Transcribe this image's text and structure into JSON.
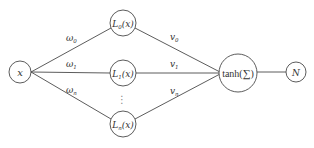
{
  "diagram": {
    "type": "neural-network",
    "colors": {
      "stroke": "#4a4a4a",
      "text": "#333333",
      "background": "#ffffff"
    },
    "nodes": {
      "input": {
        "label": "x",
        "cx": 20,
        "cy": 72,
        "r": 11
      },
      "hidden": [
        {
          "label_main": "L",
          "label_sub": "0",
          "label_arg": "(x)",
          "cx": 123,
          "cy": 23,
          "r": 13
        },
        {
          "label_main": "L",
          "label_sub": "1",
          "label_arg": "(x)",
          "cx": 123,
          "cy": 73,
          "r": 13
        },
        {
          "label_main": "L",
          "label_sub": "n",
          "label_arg": "(x)",
          "cx": 123,
          "cy": 124,
          "r": 13
        }
      ],
      "ellipsis": {
        "symbol": "⋮",
        "x": 122,
        "y": 99
      },
      "activation": {
        "label_func": "tanh(",
        "label_sigma": "∑",
        "label_close": ")",
        "cx": 238,
        "cy": 73,
        "r": 19
      },
      "output": {
        "label": "N",
        "cx": 296,
        "cy": 72,
        "r": 10
      }
    },
    "input_weights": [
      {
        "symbol": "ω",
        "sub": "0",
        "x": 66,
        "y": 41
      },
      {
        "symbol": "ω",
        "sub": "1",
        "x": 66,
        "y": 67
      },
      {
        "symbol": "ω",
        "sub": "n",
        "x": 66,
        "y": 93
      }
    ],
    "output_weights": [
      {
        "symbol": "v",
        "sub": "0",
        "x": 170,
        "y": 40
      },
      {
        "symbol": "v",
        "sub": "1",
        "x": 170,
        "y": 67
      },
      {
        "symbol": "v",
        "sub": "n",
        "x": 170,
        "y": 94
      }
    ]
  }
}
